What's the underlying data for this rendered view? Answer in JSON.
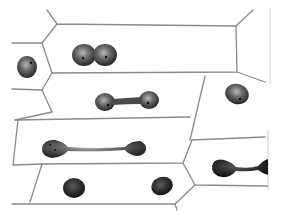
{
  "figure": {
    "description": "Ink drawing of elongated plant cells showing stages of direct nuclear division (amitosis)",
    "cells": [
      {
        "id": "top-cell",
        "nucleus_stage": "constricting",
        "shape": "dumbbell-short"
      },
      {
        "id": "middle-cell",
        "nucleus_stage": "elongating",
        "shape": "dumbbell-medium"
      },
      {
        "id": "lower-cell",
        "nucleus_stage": "stretched",
        "shape": "dumbbell-long"
      },
      {
        "id": "bottom-cell",
        "nucleus_stage": "divided",
        "shape": "two-nuclei"
      },
      {
        "id": "right-lower-cell",
        "nucleus_stage": "stretched",
        "shape": "dumbbell-long-partial"
      }
    ],
    "colors": {
      "cell_wall": "#8a8a8a",
      "nucleus_dark": "#2a2a2a",
      "nucleus_mid": "#6a6a6a",
      "background": "#ffffff"
    }
  }
}
